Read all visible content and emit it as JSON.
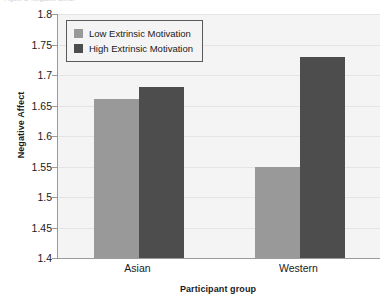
{
  "top_caption": "Figure 1. Negative affect",
  "chart_data": {
    "type": "bar",
    "title": "",
    "xlabel": "Participant group",
    "ylabel": "Negative Affect",
    "categories": [
      "Asian",
      "Western"
    ],
    "series": [
      {
        "name": "Low Extrinsic Motivation",
        "color": "#999999",
        "values": [
          1.66,
          1.55
        ]
      },
      {
        "name": "High Extrinsic Motivation",
        "color": "#4d4d4d",
        "values": [
          1.68,
          1.73
        ]
      }
    ],
    "ylim": [
      1.4,
      1.8
    ],
    "ytick_step": 0.05,
    "yticks": [
      "1.8",
      "1.75",
      "1.7",
      "1.65",
      "1.6",
      "1.55",
      "1.5",
      "1.45",
      "1.4"
    ],
    "ytick_values": [
      1.8,
      1.75,
      1.7,
      1.65,
      1.6,
      1.55,
      1.5,
      1.45,
      1.4
    ],
    "grid": true,
    "legend_position": "top-left",
    "plot_background": "#f4f4f4",
    "axis_color": "#9a9a9a"
  },
  "legend": {
    "entries": [
      {
        "label": "Low Extrinsic Motivation"
      },
      {
        "label": "High Extrinsic Motivation"
      }
    ]
  }
}
